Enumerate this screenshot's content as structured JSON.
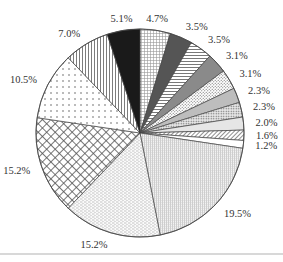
{
  "chart_data": {
    "type": "pie",
    "title": "",
    "start_angle": "12 o'clock",
    "direction": "clockwise",
    "legend": "none",
    "slices": [
      {
        "label": "4.7%",
        "value": 4.7,
        "pattern": "fine-grid",
        "color": "#ffffff"
      },
      {
        "label": "3.5%",
        "value": 3.5,
        "pattern": "solid",
        "color": "#555555"
      },
      {
        "label": "3.5%",
        "value": 3.5,
        "pattern": "horizontal-lines",
        "color": "#ffffff"
      },
      {
        "label": "3.1%",
        "value": 3.1,
        "pattern": "solid",
        "color": "#8a8a8a"
      },
      {
        "label": "3.1%",
        "value": 3.1,
        "pattern": "diagonal-dots",
        "color": "#ffffff"
      },
      {
        "label": "2.3%",
        "value": 2.3,
        "pattern": "solid",
        "color": "#bdbdbd"
      },
      {
        "label": "2.3%",
        "value": 2.3,
        "pattern": "dense-dots",
        "color": "#e8e8e8"
      },
      {
        "label": "2.0%",
        "value": 2.0,
        "pattern": "solid",
        "color": "#e6e6e6"
      },
      {
        "label": "1.6%",
        "value": 1.6,
        "pattern": "diagonal-hatch",
        "color": "#ffffff"
      },
      {
        "label": "1.2%",
        "value": 1.2,
        "pattern": "solid",
        "color": "#ffffff"
      },
      {
        "label": "19.5%",
        "value": 19.5,
        "pattern": "fine-vertical-grid",
        "color": "#ececec"
      },
      {
        "label": "15.2%",
        "value": 15.2,
        "pattern": "horizontal-dashes",
        "color": "#f4f4f4"
      },
      {
        "label": "15.2%",
        "value": 15.2,
        "pattern": "diamond-crosshatch",
        "color": "#ffffff"
      },
      {
        "label": "10.5%",
        "value": 10.5,
        "pattern": "dots",
        "color": "#ffffff"
      },
      {
        "label": "7.0%",
        "value": 7.0,
        "pattern": "vertical-lines",
        "color": "#ffffff"
      },
      {
        "label": "5.1%",
        "value": 5.1,
        "pattern": "solid",
        "color": "#1a1a1a"
      }
    ]
  }
}
